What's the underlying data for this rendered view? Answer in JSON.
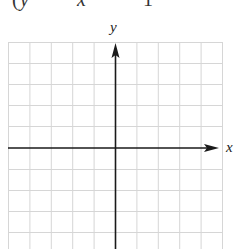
{
  "header": {
    "truncated_equation_parts": [
      "(",
      "y",
      "x",
      "1"
    ],
    "truncated_equation_note": "cut off at top edge"
  },
  "graph": {
    "x_axis_label": "x",
    "y_axis_label": "y",
    "grid": {
      "columns": 10,
      "rows_visible": 10,
      "left": 8,
      "right": 222,
      "top": 42,
      "cell_size": 21.4,
      "line_color": "#d4d4d4"
    },
    "axes": {
      "origin_px": [
        115,
        148
      ],
      "color": "#1a1a1a",
      "x_axis_arrow": "right",
      "y_axis_arrow": "up"
    }
  }
}
